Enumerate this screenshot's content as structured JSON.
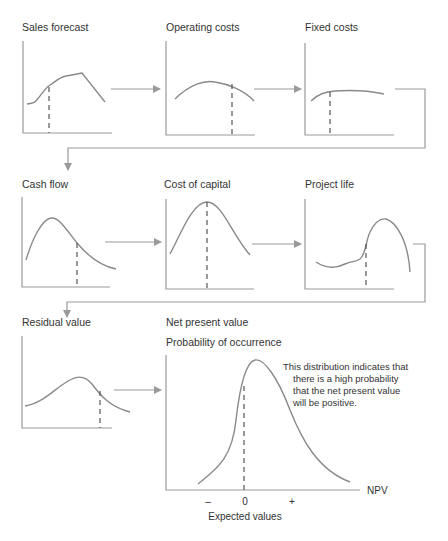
{
  "diagram": {
    "colors": {
      "background": "#ffffff",
      "axis": "#9a9a9a",
      "curve": "#8a8a8a",
      "dashed_marker": "#555555",
      "text": "#333333"
    },
    "panels": [
      {
        "id": "sales-forecast",
        "title": "Sales forecast",
        "row": 1,
        "col": 1,
        "curve_shape": "rising then plateau then drop"
      },
      {
        "id": "operating-costs",
        "title": "Operating costs",
        "row": 1,
        "col": 2,
        "curve_shape": "gentle arch"
      },
      {
        "id": "fixed-costs",
        "title": "Fixed costs",
        "row": 1,
        "col": 3,
        "curve_shape": "near-flat"
      },
      {
        "id": "cash-flow",
        "title": "Cash flow",
        "row": 2,
        "col": 1,
        "curve_shape": "right-skewed bell"
      },
      {
        "id": "cost-of-capital",
        "title": "Cost of capital",
        "row": 2,
        "col": 2,
        "curve_shape": "symmetric bell"
      },
      {
        "id": "project-life",
        "title": "Project life",
        "row": 2,
        "col": 3,
        "curve_shape": "low flat then high peak"
      },
      {
        "id": "residual-value",
        "title": "Residual value",
        "row": 3,
        "col": 1,
        "curve_shape": "wide bell"
      }
    ],
    "result": {
      "title": "Net present value",
      "y_label": "Probability of occurrence",
      "x_label": "NPV",
      "x_caption": "Expected values",
      "ticks": [
        "–",
        "0",
        "+"
      ],
      "annotation": [
        "This distribution indicates that",
        "there is a high probability",
        "that the net present value",
        "will be positive."
      ]
    },
    "flow": [
      "sales-forecast",
      "operating-costs",
      "fixed-costs",
      "cash-flow",
      "cost-of-capital",
      "project-life",
      "residual-value",
      "net-present-value"
    ]
  }
}
